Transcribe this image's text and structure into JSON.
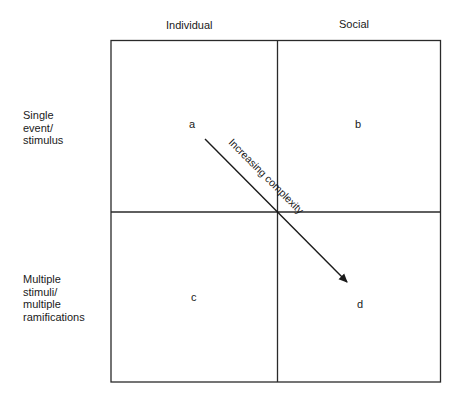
{
  "columns": [
    {
      "label": "Individual"
    },
    {
      "label": "Social"
    }
  ],
  "rows": [
    {
      "lines": [
        "Single",
        "event/",
        "stimulus"
      ]
    },
    {
      "lines": [
        "Multiple",
        "stimuli/",
        "multiple",
        "ramifications"
      ]
    }
  ],
  "cells": {
    "a": "a",
    "b": "b",
    "c": "c",
    "d": "d"
  },
  "arrow": {
    "label": "Increasing complexity",
    "from": "a",
    "to": "d"
  },
  "colors": {
    "line": "#2a2a2a",
    "text": "#1a1a1a",
    "background": "#ffffff"
  }
}
